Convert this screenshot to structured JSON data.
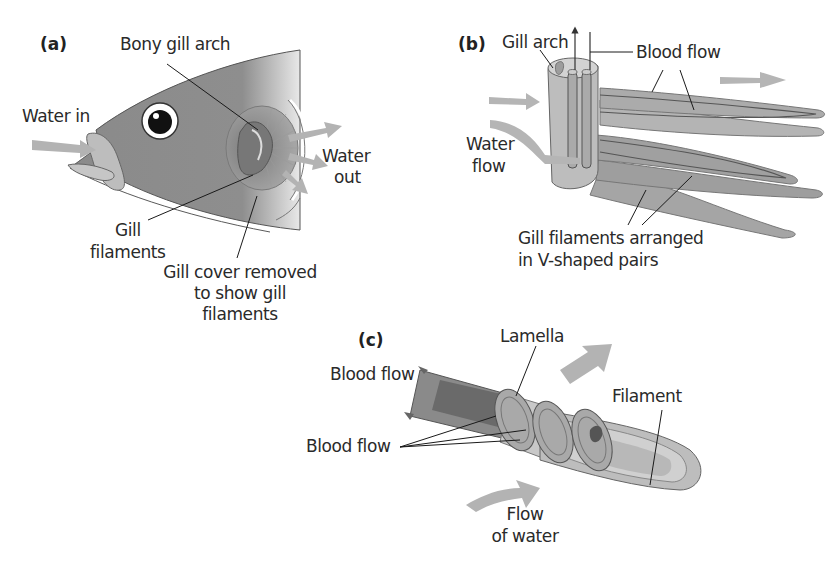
{
  "figure": {
    "panels": [
      {
        "id": "a",
        "letter": "(a)",
        "labels": {
          "bony_gill_arch": "Bony gill arch",
          "water_in": "Water in",
          "water_out_1": "Water",
          "water_out_2": "out",
          "gill_filaments_1": "Gill",
          "gill_filaments_2": "filaments",
          "gill_cover_1": "Gill cover removed",
          "gill_cover_2": "to show gill",
          "gill_cover_3": "filaments"
        }
      },
      {
        "id": "b",
        "letter": "(b)",
        "labels": {
          "gill_arch": "Gill arch",
          "blood_flow": "Blood flow",
          "water_flow_1": "Water",
          "water_flow_2": "flow",
          "pairs_1": "Gill filaments arranged",
          "pairs_2": "in V-shaped pairs"
        }
      },
      {
        "id": "c",
        "letter": "(c)",
        "labels": {
          "lamella": "Lamella",
          "blood_flow_top": "Blood flow",
          "blood_flow_bottom": "Blood flow",
          "filament": "Filament",
          "flow_of_water_1": "Flow",
          "flow_of_water_2": "of water"
        }
      }
    ],
    "colors": {
      "body_gray": "#8c8c8c",
      "light_gray": "#c4c4c4",
      "mid_gray": "#a8a8a8",
      "dark_gray": "#6e6e6e",
      "arrow_gray": "#b5b5b5",
      "line": "#1a1a1a",
      "background": "#ffffff"
    }
  }
}
